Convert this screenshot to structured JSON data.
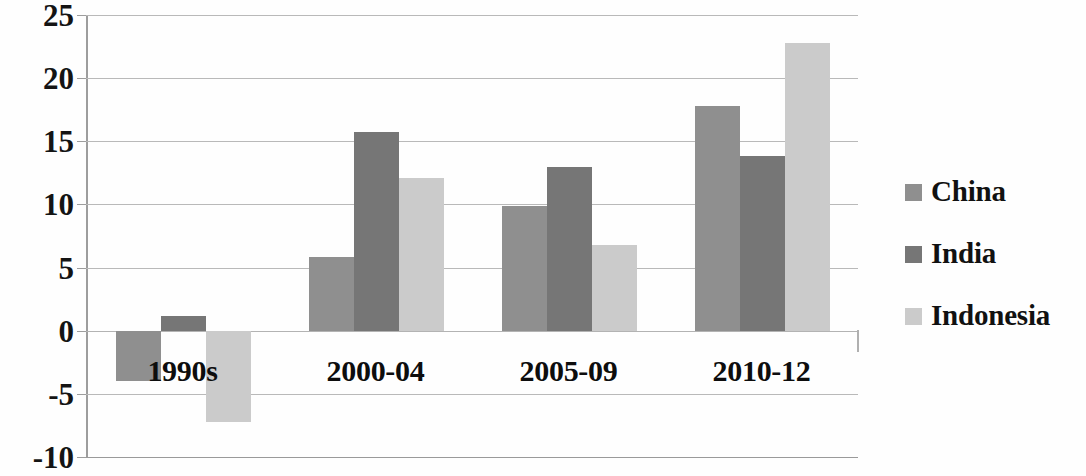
{
  "chart_data": {
    "type": "bar",
    "title": "",
    "subtitle": "",
    "xlabel": "",
    "ylabel": "",
    "categories": [
      "1990s",
      "2000-04",
      "2005-09",
      "2010-12"
    ],
    "series": [
      {
        "name": "China",
        "color": "#8f8f8f",
        "values": [
          -4.0,
          5.8,
          9.9,
          17.8
        ]
      },
      {
        "name": "India",
        "color": "#767676",
        "values": [
          1.2,
          15.7,
          13.0,
          13.8
        ]
      },
      {
        "name": "Indonesia",
        "color": "#cbcbcb",
        "values": [
          -7.2,
          12.1,
          6.8,
          22.8
        ]
      }
    ],
    "ylim": [
      -10,
      25
    ],
    "ytick_labels": [
      "25",
      "20",
      "15",
      "10",
      "5",
      "0",
      "-5",
      "-10"
    ],
    "ytick_values": [
      25,
      20,
      15,
      10,
      5,
      0,
      -5,
      -10
    ],
    "grid": true,
    "grid_axis": "y",
    "legend_position": "right",
    "legend_entries": [
      "China",
      "India",
      "Indonesia"
    ],
    "bar_orientation": "vertical",
    "grouped": true
  },
  "legend": {
    "items": [
      {
        "label": "China",
        "color": "#8f8f8f"
      },
      {
        "label": "India",
        "color": "#767676"
      },
      {
        "label": "Indonesia",
        "color": "#cbcbcb"
      }
    ]
  },
  "axis": {
    "y_ticks": [
      "25",
      "20",
      "15",
      "10",
      "5",
      "0",
      "-5",
      "-10"
    ],
    "x_labels": [
      "1990s",
      "2000-04",
      "2005-09",
      "2010-12"
    ]
  },
  "colors": {
    "china": "#8f8f8f",
    "india": "#767676",
    "indonesia": "#cbcbcb",
    "grid": "#b9b9b9",
    "axis": "#9d9d9d",
    "text": "#111111",
    "background": "#ffffff"
  }
}
